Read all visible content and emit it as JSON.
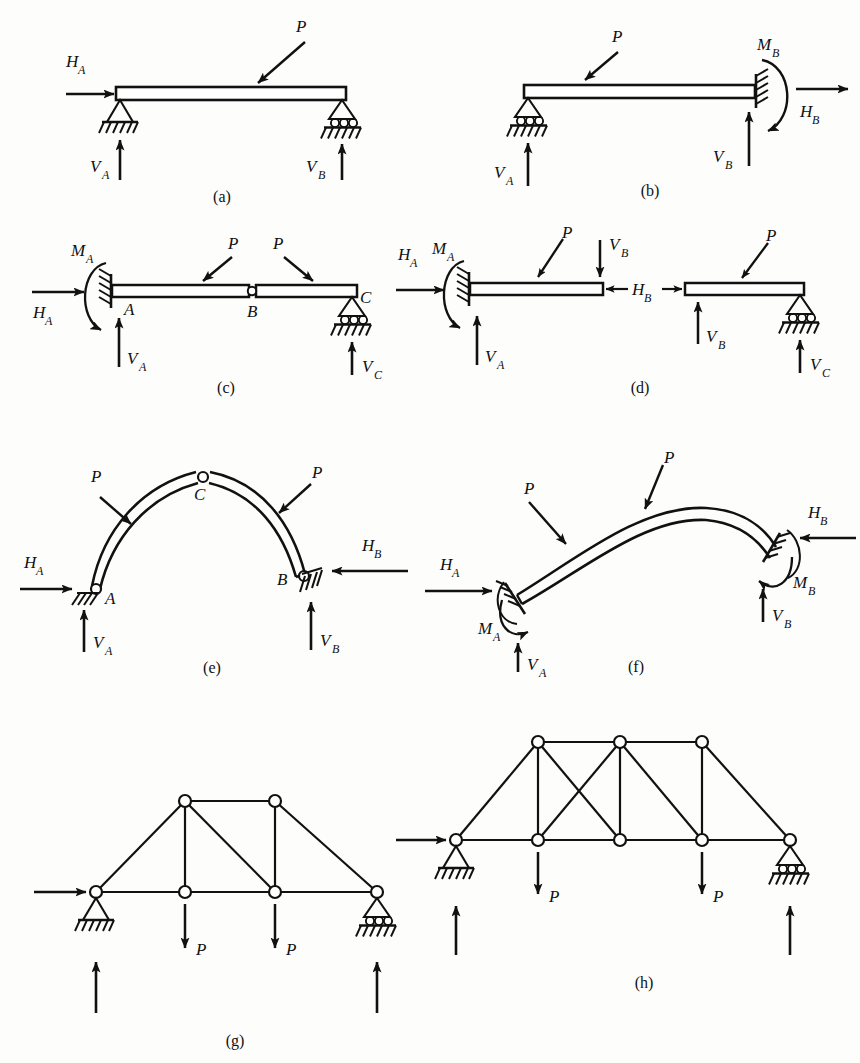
{
  "figure": {
    "background_color": "#fdfdfb",
    "ink_color": "#111111",
    "panel_count": 8
  },
  "symbols": {
    "load": "P",
    "H": "H",
    "V": "V",
    "M": "M",
    "A": "A",
    "B": "B",
    "C": "C"
  },
  "panels": [
    {
      "id": "a",
      "caption": "(a)",
      "type": "simply-supported-beam",
      "supports": [
        "pin",
        "roller"
      ],
      "labels": [
        {
          "name": "load-P",
          "base": "P",
          "sub": ""
        },
        {
          "name": "reaction-HA",
          "base": "H",
          "sub": "A"
        },
        {
          "name": "reaction-VA",
          "base": "V",
          "sub": "A"
        },
        {
          "name": "reaction-VB",
          "base": "V",
          "sub": "B"
        }
      ]
    },
    {
      "id": "b",
      "caption": "(b)",
      "type": "propped-cantilever-beam",
      "supports": [
        "roller",
        "fixed"
      ],
      "labels": [
        {
          "name": "load-P",
          "base": "P",
          "sub": ""
        },
        {
          "name": "reaction-VA",
          "base": "V",
          "sub": "A"
        },
        {
          "name": "reaction-VB",
          "base": "V",
          "sub": "B"
        },
        {
          "name": "reaction-MB",
          "base": "M",
          "sub": "B"
        },
        {
          "name": "reaction-HB",
          "base": "H",
          "sub": "B"
        }
      ]
    },
    {
      "id": "c",
      "caption": "(c)",
      "type": "beam-with-internal-hinge",
      "supports": [
        "fixed",
        "roller"
      ],
      "joints": [
        "A",
        "B",
        "C"
      ],
      "labels": [
        {
          "name": "load-P-1",
          "base": "P",
          "sub": ""
        },
        {
          "name": "load-P-2",
          "base": "P",
          "sub": ""
        },
        {
          "name": "reaction-MA",
          "base": "M",
          "sub": "A"
        },
        {
          "name": "reaction-HA",
          "base": "H",
          "sub": "A"
        },
        {
          "name": "reaction-VA",
          "base": "V",
          "sub": "A"
        },
        {
          "name": "reaction-VC",
          "base": "V",
          "sub": "C"
        },
        {
          "name": "joint-A",
          "base": "A",
          "sub": ""
        },
        {
          "name": "joint-B",
          "base": "B",
          "sub": ""
        },
        {
          "name": "joint-C",
          "base": "C",
          "sub": ""
        }
      ]
    },
    {
      "id": "d",
      "caption": "(d)",
      "type": "exploded-free-bodies",
      "supports": [
        "fixed",
        "roller"
      ],
      "labels": [
        {
          "name": "load-P-left",
          "base": "P",
          "sub": ""
        },
        {
          "name": "load-P-right",
          "base": "P",
          "sub": ""
        },
        {
          "name": "reaction-MA",
          "base": "M",
          "sub": "A"
        },
        {
          "name": "reaction-HA",
          "base": "H",
          "sub": "A"
        },
        {
          "name": "reaction-VA",
          "base": "V",
          "sub": "A"
        },
        {
          "name": "force-VB-top",
          "base": "V",
          "sub": "B"
        },
        {
          "name": "force-HB",
          "base": "H",
          "sub": "B"
        },
        {
          "name": "force-VB-bottom",
          "base": "V",
          "sub": "B"
        },
        {
          "name": "reaction-VC",
          "base": "V",
          "sub": "C"
        }
      ]
    },
    {
      "id": "e",
      "caption": "(e)",
      "type": "three-hinged-arch",
      "supports": [
        "pin",
        "pin"
      ],
      "joints": [
        "A",
        "B",
        "C"
      ],
      "labels": [
        {
          "name": "load-P-left",
          "base": "P",
          "sub": ""
        },
        {
          "name": "load-P-right",
          "base": "P",
          "sub": ""
        },
        {
          "name": "reaction-HA",
          "base": "H",
          "sub": "A"
        },
        {
          "name": "reaction-VA",
          "base": "V",
          "sub": "A"
        },
        {
          "name": "reaction-HB",
          "base": "H",
          "sub": "B"
        },
        {
          "name": "reaction-VB",
          "base": "V",
          "sub": "B"
        },
        {
          "name": "crown-C",
          "base": "C",
          "sub": ""
        },
        {
          "name": "springing-A",
          "base": "A",
          "sub": ""
        },
        {
          "name": "springing-B",
          "base": "B",
          "sub": ""
        }
      ]
    },
    {
      "id": "f",
      "caption": "(f)",
      "type": "fixed-ended-arch",
      "supports": [
        "fixed",
        "fixed"
      ],
      "labels": [
        {
          "name": "load-P-left",
          "base": "P",
          "sub": ""
        },
        {
          "name": "load-P-right",
          "base": "P",
          "sub": ""
        },
        {
          "name": "reaction-HA",
          "base": "H",
          "sub": "A"
        },
        {
          "name": "reaction-MA",
          "base": "M",
          "sub": "A"
        },
        {
          "name": "reaction-VA",
          "base": "V",
          "sub": "A"
        },
        {
          "name": "reaction-HB",
          "base": "H",
          "sub": "B"
        },
        {
          "name": "reaction-MB",
          "base": "M",
          "sub": "B"
        },
        {
          "name": "reaction-VB",
          "base": "V",
          "sub": "B"
        }
      ]
    },
    {
      "id": "g",
      "caption": "(g)",
      "type": "truss-determinate",
      "supports": [
        "pin",
        "roller"
      ],
      "panel_loads": [
        "P",
        "P"
      ],
      "joint_count": 6,
      "labels": [
        {
          "name": "load-P-1",
          "base": "P",
          "sub": ""
        },
        {
          "name": "load-P-2",
          "base": "P",
          "sub": ""
        }
      ]
    },
    {
      "id": "h",
      "caption": "(h)",
      "type": "truss-indeterminate",
      "supports": [
        "pin",
        "roller"
      ],
      "panel_loads": [
        "P",
        "P"
      ],
      "joint_count": 8,
      "labels": [
        {
          "name": "load-P-1",
          "base": "P",
          "sub": ""
        },
        {
          "name": "load-P-2",
          "base": "P",
          "sub": ""
        }
      ]
    }
  ]
}
